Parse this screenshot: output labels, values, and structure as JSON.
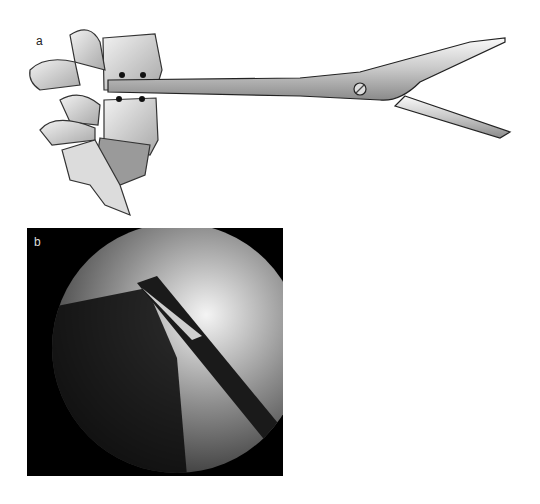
{
  "figure": {
    "panels": [
      {
        "label": "a",
        "description": "Illustration of lumbar vertebrae with long surgical scissors/forceps inserted into the intervertebral disc space; four marker dots around the instrument tip"
      },
      {
        "label": "b",
        "description": "Fluoroscopic (X-ray) image showing the instrument tip with open jaws at the disc space"
      }
    ]
  }
}
